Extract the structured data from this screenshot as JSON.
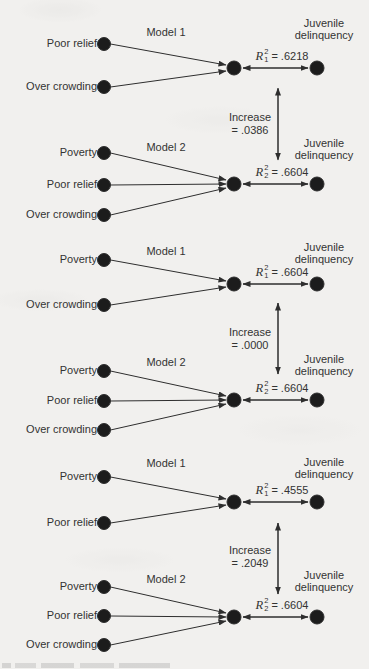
{
  "figure": {
    "background": "#f1f0ee",
    "ink_color": "#2e2e2e",
    "outcome": {
      "line1": "Juvenile",
      "line2": "delinquency"
    },
    "r_symbol": "R",
    "r_sup": "2",
    "sections": [
      {
        "title": "Model 1",
        "predictors": [
          "Poor relief",
          "Over crowding"
        ],
        "r_sub": "1",
        "r_value": "= .6218"
      },
      {
        "title": "Model 2",
        "predictors": [
          "Poverty",
          "Poor relief",
          "Over crowding"
        ],
        "r_sub": "2",
        "r_value": "= .6604"
      },
      {
        "title": "Model 1",
        "predictors": [
          "Poverty",
          "Over crowding"
        ],
        "r_sub": "1",
        "r_value": "= .6604"
      },
      {
        "title": "Model 2",
        "predictors": [
          "Poverty",
          "Poor relief",
          "Over crowding"
        ],
        "r_sub": "2",
        "r_value": "= .6604"
      },
      {
        "title": "Model 1",
        "predictors": [
          "Poverty",
          "Poor relief"
        ],
        "r_sub": "1",
        "r_value": "= .4555"
      },
      {
        "title": "Model 2",
        "predictors": [
          "Poverty",
          "Poor relief",
          "Over crowding"
        ],
        "r_sub": "2",
        "r_value": "= .6604"
      }
    ],
    "increases": [
      {
        "line1": "Increase",
        "line2": "= .0386"
      },
      {
        "line1": "Increase",
        "line2": "= .0000"
      },
      {
        "line1": "Increase",
        "line2": "= .2049"
      }
    ]
  }
}
